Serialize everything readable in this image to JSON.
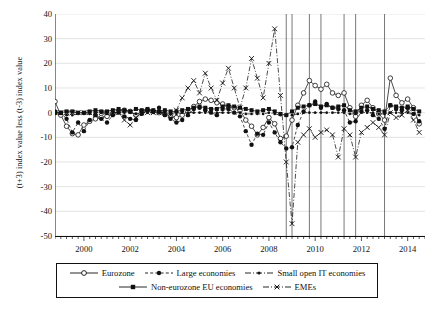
{
  "chart_data": {
    "type": "line",
    "title": "",
    "xlabel": "",
    "ylabel": "(t+3) index value less (t-3) index value",
    "xlim": [
      1998.75,
      2014.75
    ],
    "ylim": [
      -50,
      40
    ],
    "ytick_labels": [
      "40",
      "30",
      "20",
      "10",
      "0",
      "-10",
      "-20",
      "-30",
      "-40",
      "-50"
    ],
    "ytick_values": [
      40,
      30,
      20,
      10,
      0,
      -10,
      -20,
      -30,
      -40,
      -50
    ],
    "xtick_labels": [
      "2000",
      "2002",
      "2004",
      "2006",
      "2008",
      "2010",
      "2012",
      "2014"
    ],
    "xtick_values": [
      2000,
      2002,
      2004,
      2006,
      2008,
      2010,
      2012,
      2014
    ],
    "grid": "horizontal",
    "legend_position": "below",
    "minor_tick_interval": 0.25,
    "vertical_event_lines": [
      2008.75,
      2009.0,
      2009.75,
      2010.25,
      2011.25,
      2011.75,
      2013.0
    ],
    "x": [
      1998.75,
      1999.0,
      1999.25,
      1999.5,
      1999.75,
      2000.0,
      2000.25,
      2000.5,
      2000.75,
      2001.0,
      2001.25,
      2001.5,
      2001.75,
      2002.0,
      2002.25,
      2002.5,
      2002.75,
      2003.0,
      2003.25,
      2003.5,
      2003.75,
      2004.0,
      2004.25,
      2004.5,
      2004.75,
      2005.0,
      2005.25,
      2005.5,
      2005.75,
      2006.0,
      2006.25,
      2006.5,
      2006.75,
      2007.0,
      2007.25,
      2007.5,
      2007.75,
      2008.0,
      2008.25,
      2008.5,
      2008.75,
      2009.0,
      2009.25,
      2009.5,
      2009.75,
      2010.0,
      2010.25,
      2010.5,
      2010.75,
      2011.0,
      2011.25,
      2011.5,
      2011.75,
      2012.0,
      2012.25,
      2012.5,
      2012.75,
      2013.0,
      2013.25,
      2013.5,
      2013.75,
      2014.0,
      2014.25,
      2014.5
    ],
    "series": [
      {
        "name": "Eurozone",
        "marker": "open-circle",
        "line": "solid",
        "values": [
          4.5,
          -1.0,
          -5.5,
          -8.5,
          -9.0,
          -5.0,
          -3.5,
          -2.5,
          -2.0,
          -1.5,
          -0.5,
          0.5,
          1.0,
          0.5,
          -1.0,
          0.5,
          1.0,
          0.5,
          0.0,
          -0.5,
          -1.5,
          -2.0,
          -1.0,
          0.5,
          2.5,
          4.5,
          5.5,
          5.0,
          4.0,
          3.5,
          2.5,
          2.0,
          1.0,
          -3.0,
          -5.5,
          -9.0,
          -6.0,
          -2.0,
          -4.5,
          -10.5,
          -9.5,
          -3.0,
          3.0,
          8.0,
          13.0,
          11.0,
          9.5,
          11.5,
          8.0,
          7.0,
          8.0,
          2.0,
          -1.5,
          3.0,
          5.0,
          2.0,
          -0.5,
          -3.0,
          14.0,
          7.0,
          4.0,
          5.5,
          2.0,
          -4.5
        ]
      },
      {
        "name": "Large economies",
        "marker": "filled-circle",
        "line": "dashed",
        "values": [
          0.5,
          0.0,
          -2.5,
          -8.0,
          -4.0,
          -7.5,
          -3.0,
          -1.0,
          -2.5,
          -4.0,
          -1.0,
          0.0,
          -1.5,
          -2.5,
          -3.0,
          -0.5,
          1.0,
          0.5,
          2.0,
          -1.0,
          -2.5,
          -4.0,
          -3.0,
          -1.0,
          1.5,
          2.0,
          1.0,
          0.0,
          -1.0,
          1.5,
          1.5,
          0.0,
          -1.5,
          -7.5,
          -13.0,
          -8.5,
          -9.0,
          -4.0,
          -8.0,
          -12.0,
          -14.5,
          -14.0,
          -5.0,
          0.5,
          3.0,
          4.5,
          2.0,
          3.5,
          2.0,
          1.5,
          1.0,
          -4.0,
          -3.5,
          0.5,
          1.0,
          -1.0,
          -2.5,
          -6.5,
          3.0,
          1.5,
          1.0,
          2.0,
          -0.5,
          -3.5
        ]
      },
      {
        "name": "Small open IT economies",
        "marker": "small-dot",
        "line": "dash-dot",
        "values": [
          -0.5,
          -0.5,
          -1.0,
          -1.0,
          -0.5,
          -0.5,
          -0.5,
          0.0,
          0.0,
          -0.5,
          0.0,
          0.0,
          0.0,
          0.0,
          -0.5,
          0.0,
          0.0,
          0.0,
          0.0,
          0.0,
          -0.5,
          -0.5,
          0.0,
          0.0,
          0.0,
          0.0,
          0.0,
          0.0,
          0.0,
          0.0,
          0.0,
          0.0,
          0.0,
          -0.5,
          -0.5,
          -0.5,
          -0.5,
          0.0,
          -0.5,
          -1.0,
          -1.0,
          -1.0,
          -0.5,
          0.0,
          0.0,
          0.0,
          0.0,
          0.0,
          0.0,
          0.0,
          0.0,
          -0.5,
          -0.5,
          0.0,
          0.0,
          0.0,
          -0.5,
          -0.5,
          0.0,
          0.0,
          0.0,
          0.0,
          -0.5,
          -1.0
        ]
      },
      {
        "name": "Non-eurozone EU economies",
        "marker": "filled-square",
        "line": "solid",
        "values": [
          0.0,
          0.0,
          0.5,
          0.5,
          0.0,
          0.0,
          0.5,
          1.0,
          0.5,
          0.5,
          1.0,
          1.5,
          1.0,
          0.5,
          1.5,
          1.0,
          1.5,
          1.0,
          0.5,
          1.0,
          0.5,
          0.5,
          1.0,
          1.5,
          2.0,
          2.5,
          2.0,
          1.5,
          1.5,
          2.5,
          3.0,
          2.5,
          2.0,
          1.5,
          1.0,
          0.5,
          1.0,
          1.5,
          0.5,
          -0.5,
          -1.0,
          0.5,
          2.0,
          2.5,
          3.0,
          3.5,
          2.5,
          3.0,
          2.0,
          2.5,
          3.0,
          1.0,
          0.5,
          2.0,
          2.5,
          1.5,
          1.0,
          0.5,
          3.0,
          2.5,
          2.0,
          2.5,
          1.5,
          0.5
        ]
      },
      {
        "name": "EMEs",
        "marker": "x-cross",
        "line": "dash-dot",
        "values": [
          0.0,
          0.0,
          0.0,
          0.0,
          0.0,
          0.0,
          0.0,
          0.0,
          0.0,
          0.0,
          0.0,
          0.0,
          -3.0,
          -5.0,
          -2.0,
          0.0,
          0.0,
          0.0,
          0.0,
          0.0,
          -1.0,
          1.0,
          6.0,
          10.0,
          13.0,
          8.0,
          16.0,
          10.0,
          5.0,
          12.0,
          18.0,
          10.0,
          2.0,
          10.0,
          22.0,
          14.0,
          6.0,
          20.0,
          34.0,
          7.0,
          -20.0,
          -45.0,
          -12.0,
          -9.0,
          -6.5,
          -10.0,
          -8.0,
          -7.0,
          -9.0,
          -18.0,
          -6.5,
          -9.0,
          -18.0,
          -8.0,
          -6.0,
          -4.0,
          -6.0,
          -9.0,
          0.0,
          -2.0,
          -1.0,
          1.0,
          -3.0,
          -8.0
        ]
      }
    ]
  },
  "legend": {
    "items": [
      {
        "label": "Eurozone"
      },
      {
        "label": "Large economies"
      },
      {
        "label": "Small open IT economies"
      },
      {
        "label": "Non-eurozone EU economies"
      },
      {
        "label": "EMEs"
      }
    ]
  }
}
